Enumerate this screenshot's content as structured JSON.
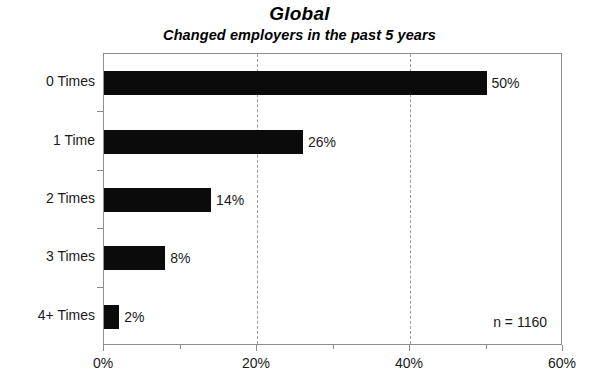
{
  "chart_data": {
    "type": "bar",
    "orientation": "horizontal",
    "title": "Global",
    "subtitle": "Changed employers in the past 5 years",
    "xlabel": "",
    "ylabel": "",
    "categories": [
      "0 Times",
      "1 Time",
      "2 Times",
      "3 Times",
      "4+ Times"
    ],
    "values": [
      50,
      26,
      14,
      8,
      2
    ],
    "value_labels": [
      "50%",
      "26%",
      "14%",
      "8%",
      "2%"
    ],
    "xlim": [
      0,
      60
    ],
    "xticks": [
      0,
      20,
      40,
      60
    ],
    "xtick_labels": [
      "0%",
      "20%",
      "40%",
      "60%"
    ],
    "gridlines": [
      20,
      40
    ],
    "grid": true,
    "grid_style": "dashed",
    "legend": null,
    "legend_position": "none",
    "annotation": "n = 1160",
    "annotation_position": "bottom-right",
    "bar_color": "#0b0b0b",
    "background_color": "#ffffff",
    "frame_color": "#8d8d8d"
  }
}
